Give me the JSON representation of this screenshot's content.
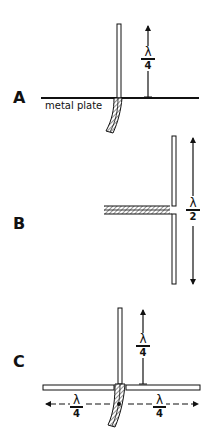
{
  "figure": {
    "panels": [
      {
        "id": "A",
        "label": "A",
        "description": "Quarter-wave vertical over metal plate",
        "plate_label": "metal plate",
        "dimension": {
          "numerator": "λ",
          "denominator": "4"
        }
      },
      {
        "id": "B",
        "label": "B",
        "description": "Half-wave dipole fed by coaxial line",
        "dimension": {
          "numerator": "λ",
          "denominator": "2"
        }
      },
      {
        "id": "C",
        "label": "C",
        "description": "Quarter-wave vertical with two quarter-wave radials",
        "dimension_vertical": {
          "numerator": "λ",
          "denominator": "4"
        },
        "dimension_left": {
          "numerator": "λ",
          "denominator": "4"
        },
        "dimension_right": {
          "numerator": "λ",
          "denominator": "4"
        }
      }
    ],
    "colors": {
      "ink": "#111111",
      "coax_fill": "#b8b8b8",
      "background": "#ffffff"
    }
  }
}
